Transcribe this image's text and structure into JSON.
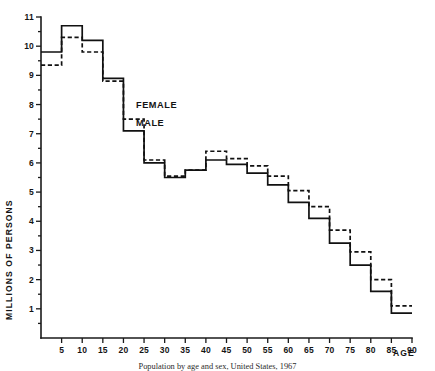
{
  "figure": {
    "caption": "Population by age and sex, United States, 1967",
    "background_color": "#ffffff",
    "ink_color": "#111111"
  },
  "axes": {
    "y_title": "MILLIONS OF PERSONS",
    "x_title": "AGE",
    "y_ticks": [
      "1",
      "2",
      "3",
      "4",
      "5",
      "6",
      "7",
      "8",
      "9",
      "10",
      "11"
    ],
    "x_ticks": [
      "5",
      "10",
      "15",
      "20",
      "25",
      "30",
      "35",
      "40",
      "45",
      "50",
      "55",
      "60",
      "65",
      "70",
      "75",
      "80",
      "85",
      "90"
    ],
    "grid": "off"
  },
  "legend": {
    "female_label": "FEMALE",
    "male_label": "MALE",
    "position": "inline-annotation"
  },
  "chart_data": {
    "type": "line",
    "subtype": "step-histogram",
    "title": "Population by age and sex, United States, 1967",
    "xlabel": "AGE",
    "ylabel": "MILLIONS OF PERSONS",
    "xlim": [
      0,
      90
    ],
    "ylim": [
      0,
      11
    ],
    "grid": false,
    "legend_position": "inline-annotation",
    "bin_width": 5,
    "bin_edges": [
      0,
      5,
      10,
      15,
      20,
      25,
      30,
      35,
      40,
      45,
      50,
      55,
      60,
      65,
      70,
      75,
      80,
      85,
      90
    ],
    "categories": [
      "0-5",
      "5-10",
      "10-15",
      "15-20",
      "20-25",
      "25-30",
      "30-35",
      "35-40",
      "40-45",
      "45-50",
      "50-55",
      "55-60",
      "60-65",
      "65-70",
      "70-75",
      "75-80",
      "80-85",
      "85-90"
    ],
    "series": [
      {
        "name": "MALE",
        "style": "solid",
        "values": [
          9.8,
          10.7,
          10.2,
          8.9,
          7.1,
          6.0,
          5.5,
          5.75,
          6.1,
          5.95,
          5.65,
          5.25,
          4.65,
          4.1,
          3.25,
          2.5,
          1.6,
          0.85
        ]
      },
      {
        "name": "FEMALE",
        "style": "dashed",
        "values": [
          9.35,
          10.3,
          9.8,
          8.8,
          7.5,
          6.1,
          5.55,
          5.75,
          6.4,
          6.15,
          5.9,
          5.55,
          5.05,
          4.5,
          3.7,
          2.95,
          2.0,
          1.1
        ]
      }
    ]
  }
}
